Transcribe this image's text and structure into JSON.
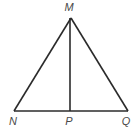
{
  "figure": {
    "type": "geometry-diagram",
    "shape": "triangle-with-cevian",
    "background_color": "#ffffff",
    "line_color": "#2b2b2b",
    "label_color": "#4a4a4a",
    "canvas": {
      "width": 139,
      "height": 132
    },
    "vertices": [
      {
        "id": "M",
        "label": "M",
        "x": 71,
        "y": 18,
        "label_x": 69,
        "label_y": 11,
        "role": "apex"
      },
      {
        "id": "N",
        "label": "N",
        "x": 14,
        "y": 111,
        "label_x": 13,
        "label_y": 125,
        "role": "base-left"
      },
      {
        "id": "P",
        "label": "P",
        "x": 70,
        "y": 111,
        "label_x": 69,
        "label_y": 125,
        "role": "base-foot"
      },
      {
        "id": "Q",
        "label": "Q",
        "x": 128,
        "y": 111,
        "label_x": 126,
        "label_y": 125,
        "role": "base-right"
      }
    ],
    "segments": [
      {
        "id": "MN",
        "from": "M",
        "to": "N",
        "x1": 71,
        "y1": 18,
        "x2": 14,
        "y2": 111,
        "width": 1.6
      },
      {
        "id": "MQ",
        "from": "M",
        "to": "Q",
        "x1": 71,
        "y1": 18,
        "x2": 128,
        "y2": 111,
        "width": 1.6
      },
      {
        "id": "NQ",
        "from": "N",
        "to": "Q",
        "x1": 14,
        "y1": 111,
        "x2": 128,
        "y2": 111,
        "width": 1.6
      },
      {
        "id": "MP",
        "from": "M",
        "to": "P",
        "x1": 70,
        "y1": 18,
        "x2": 70,
        "y2": 111,
        "width": 1.6
      }
    ]
  }
}
